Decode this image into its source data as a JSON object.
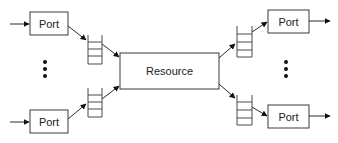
{
  "diagram": {
    "type": "queueing-network",
    "colors": {
      "stroke": "#3a3a3a",
      "text": "#222222",
      "background": "#ffffff"
    },
    "input_ports": [
      {
        "label": "Port"
      },
      {
        "label": "Port"
      }
    ],
    "resource": {
      "label": "Resource"
    },
    "output_ports": [
      {
        "label": "Port"
      },
      {
        "label": "Port"
      }
    ],
    "input_queues": 2,
    "output_queues": 2,
    "ellipsis": [
      "⋮",
      "⋮"
    ]
  }
}
